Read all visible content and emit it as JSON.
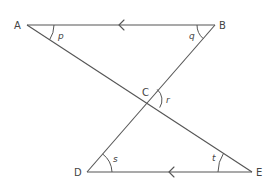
{
  "diagram": {
    "type": "geometry",
    "colors": {
      "stroke": "#555555",
      "text": "#444444",
      "background": "#ffffff"
    },
    "points": {
      "A": {
        "label": "A",
        "x": 27,
        "y": 25
      },
      "B": {
        "label": "B",
        "x": 215,
        "y": 25
      },
      "C": {
        "label": "C",
        "x": 148,
        "y": 100
      },
      "D": {
        "label": "D",
        "x": 87,
        "y": 172
      },
      "E": {
        "label": "E",
        "x": 252,
        "y": 172
      }
    },
    "segments": [
      "AB",
      "DE",
      "AE",
      "BD"
    ],
    "parallel_marks": [
      {
        "segment": "AB",
        "direction": "left",
        "x": 120,
        "y": 25
      },
      {
        "segment": "DE",
        "direction": "left",
        "x": 170,
        "y": 172
      }
    ],
    "angles": {
      "p": {
        "label": "p",
        "vertex": "A"
      },
      "q": {
        "label": "q",
        "vertex": "B"
      },
      "r": {
        "label": "r",
        "vertex": "C"
      },
      "s": {
        "label": "s",
        "vertex": "D"
      },
      "t": {
        "label": "t",
        "vertex": "E"
      }
    }
  }
}
